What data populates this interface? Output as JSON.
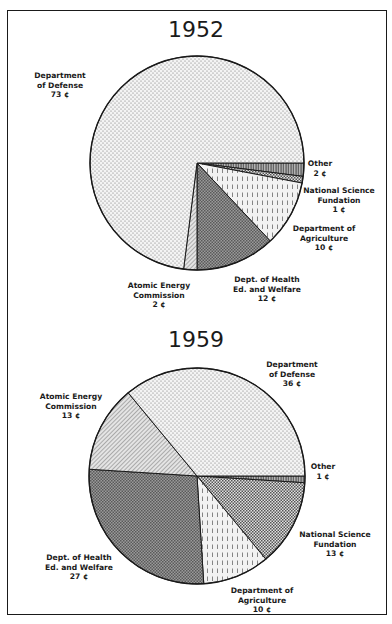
{
  "chart_data": [
    {
      "type": "pie",
      "title": "1952",
      "unit": "¢",
      "categories": [
        "Other",
        "National Science Fundation",
        "Department of Agriculture",
        "Dept. of Health Ed. and Welfare",
        "Atomic Energy Commission",
        "Department of Defense"
      ],
      "values": [
        2,
        1,
        10,
        12,
        2,
        73
      ],
      "start_angle_deg": 0,
      "direction": "clockwise",
      "labels": [
        {
          "lines": [
            "Other",
            "2 ¢"
          ]
        },
        {
          "lines": [
            "National Science",
            "Fundation",
            "1 ¢"
          ]
        },
        {
          "lines": [
            "Department of",
            "Agriculture",
            "10 ¢"
          ]
        },
        {
          "lines": [
            "Dept. of Health",
            "Ed. and Welfare",
            "12 ¢"
          ]
        },
        {
          "lines": [
            "Atomic Energy",
            "Commission",
            "2 ¢"
          ]
        },
        {
          "lines": [
            "Department",
            "of Defense",
            "73 ¢"
          ]
        }
      ]
    },
    {
      "type": "pie",
      "title": "1959",
      "unit": "¢",
      "categories": [
        "Other",
        "National Science Fundation",
        "Department of Agriculture",
        "Dept. of Health Ed. and Welfare",
        "Atomic Energy Commission",
        "Department of Defense"
      ],
      "values": [
        1,
        13,
        10,
        27,
        13,
        36
      ],
      "start_angle_deg": 0,
      "direction": "clockwise",
      "labels": [
        {
          "lines": [
            "Other",
            "1 ¢"
          ]
        },
        {
          "lines": [
            "National Science",
            "Fundation",
            "13 ¢"
          ]
        },
        {
          "lines": [
            "Department of",
            "Agriculture",
            "10 ¢"
          ]
        },
        {
          "lines": [
            "Dept. of Health",
            "Ed. and Welfare",
            "27 ¢"
          ]
        },
        {
          "lines": [
            "Atomic Energy",
            "Commission",
            "13 ¢"
          ]
        },
        {
          "lines": [
            "Department",
            "of Defense",
            "36 ¢"
          ]
        }
      ]
    }
  ]
}
